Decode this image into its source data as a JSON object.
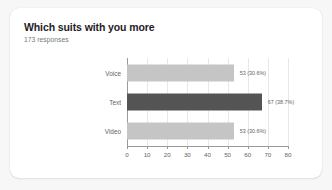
{
  "card": {
    "title": "Which suits with you more",
    "subtitle": "173 responses"
  },
  "colors": {
    "page_background": "#f7f7f7",
    "card_background": "#ffffff",
    "bar_default": "#c5c5c5",
    "bar_highlight": "#545454",
    "axis": "#9a9a9a",
    "gridline": "#e8e8e8",
    "title_text": "#1f2023",
    "muted_text": "#5f6368",
    "subtitle_text": "#73787d"
  },
  "chart_data": {
    "type": "bar",
    "orientation": "horizontal",
    "title": "Which suits with you more",
    "subtitle": "173 responses",
    "xlabel": "",
    "ylabel": "",
    "xlim": [
      0,
      80
    ],
    "xticks": [
      0,
      10,
      20,
      30,
      40,
      50,
      60,
      70,
      80
    ],
    "xtick_labels": [
      "0",
      "10",
      "20",
      "30",
      "40",
      "50",
      "60",
      "70",
      "80"
    ],
    "grid": true,
    "legend": false,
    "total_responses": 173,
    "categories": [
      "Voice",
      "Text",
      "Video"
    ],
    "values": [
      53,
      67,
      53
    ],
    "percentages": [
      "30.6%",
      "38.7%",
      "30.6%"
    ],
    "data_labels": [
      "53 (30.6%)",
      "67 (38.7%)",
      "53 (30.6%)"
    ],
    "bar_colors": [
      "#c5c5c5",
      "#545454",
      "#c5c5c5"
    ],
    "bars": [
      {
        "category": "Voice",
        "value": 53,
        "percent": "30.6%",
        "label": "53 (30.6%)",
        "color": "#c5c5c5",
        "highlighted": false
      },
      {
        "category": "Text",
        "value": 67,
        "percent": "38.7%",
        "label": "67 (38.7%)",
        "color": "#545454",
        "highlighted": true
      },
      {
        "category": "Video",
        "value": 53,
        "percent": "30.6%",
        "label": "53 (30.6%)",
        "color": "#c5c5c5",
        "highlighted": false
      }
    ]
  }
}
